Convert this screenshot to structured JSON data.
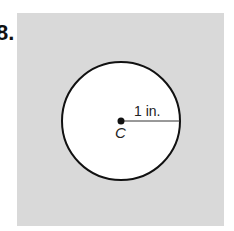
{
  "problem": {
    "number_label": "8."
  },
  "figure": {
    "background_color": "#d9d9d9",
    "circle": {
      "center_label": "C",
      "radius_label": "1 in.",
      "fill": "#ffffff",
      "stroke": "#111111"
    }
  }
}
